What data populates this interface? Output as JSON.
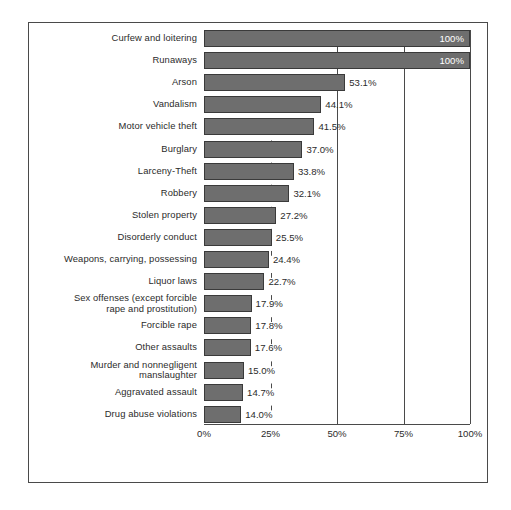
{
  "figure": {
    "background_color": "#ffffff",
    "frame_color": "#4a4a4a",
    "bar_fill_color": "#6e6e6e",
    "bar_border_color": "#3a3a3a",
    "text_color": "#2b2b2b",
    "inside_label_color": "#ffffff"
  },
  "chart_data": {
    "type": "bar",
    "orientation": "horizontal",
    "title": "",
    "subtitle": "",
    "xlabel": "",
    "ylabel": "",
    "xlim": [
      0,
      100
    ],
    "xticks": [
      "0%",
      "25%",
      "50%",
      "75%",
      "100%"
    ],
    "xtick_values": [
      0,
      25,
      50,
      75,
      100
    ],
    "grid": "vertical",
    "legend": "none",
    "categories": [
      "Curfew and loitering",
      "Runaways",
      "Arson",
      "Vandalism",
      "Motor vehicle theft",
      "Burglary",
      "Larceny-Theft",
      "Robbery",
      "Stolen property",
      "Disorderly conduct",
      "Weapons, carrying, possessing",
      "Liquor laws",
      "Sex offenses (except forcible\nrape and prostitution)",
      "Forcible rape",
      "Other assaults",
      "Murder and nonnegligent\nmanslaughter",
      "Aggravated assault",
      "Drug abuse violations"
    ],
    "values": [
      100,
      100,
      53.1,
      44.1,
      41.5,
      37.0,
      33.8,
      32.1,
      27.2,
      25.5,
      24.4,
      22.7,
      17.9,
      17.8,
      17.6,
      15.0,
      14.7,
      14.0
    ],
    "value_labels": [
      "100%",
      "100%",
      "53.1%",
      "44.1%",
      "41.5%",
      "37.0%",
      "33.8%",
      "32.1%",
      "27.2%",
      "25.5%",
      "24.4%",
      "22.7%",
      "17.9%",
      "17.8%",
      "17.6%",
      "15.0%",
      "14.7%",
      "14.0%"
    ],
    "label_placement": [
      "inside",
      "inside",
      "outside",
      "outside",
      "outside",
      "outside",
      "outside",
      "outside",
      "outside",
      "outside",
      "outside",
      "outside",
      "outside",
      "outside",
      "outside",
      "outside",
      "outside",
      "outside"
    ]
  }
}
